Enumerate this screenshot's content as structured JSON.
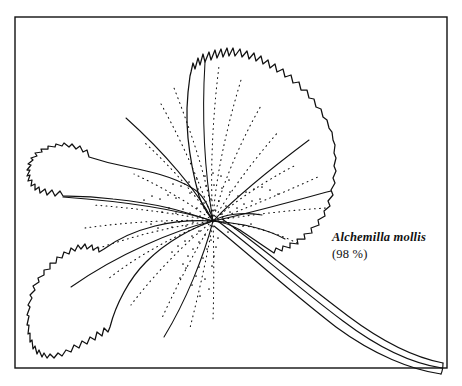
{
  "figure": {
    "kind": "botanical-line-drawing",
    "background_color": "#ffffff",
    "ink_color": "#111111",
    "frame": {
      "x": 15,
      "y": 17,
      "width": 432,
      "height": 351,
      "stroke_width": 1.4
    }
  },
  "label": {
    "species": "Alchemilla mollis",
    "percentage": "(98 %)"
  },
  "leaf": {
    "vein_origin_x": 213,
    "vein_origin_y": 221,
    "lobe_count": 7,
    "margin": "serrate",
    "primary_veins": [
      "M213,221 C204,178 200,120 206,60",
      "M213,221 C196,190 160,150 123,116",
      "M213,221 C178,208 120,200 64,196",
      "M213,221 C176,229 118,253 70,286",
      "M213,221 C203,255 185,300 163,336",
      "M213,221 C236,197 272,166 308,139",
      "M213,221 C250,212 292,200 330,190"
    ],
    "petiole": {
      "path": "M216,224 C250,250 300,300 352,336 C390,360 420,370 441,372",
      "width_at_base": 9,
      "width_at_tip": 4
    }
  }
}
